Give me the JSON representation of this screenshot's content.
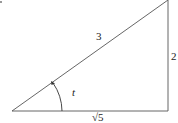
{
  "diagram": {
    "type": "right-triangle",
    "hypotenuse_label": "3",
    "opposite_label": "2",
    "adjacent_label": "√5",
    "angle_label": "t",
    "colors": {
      "stroke": "#555555",
      "text": "#222222",
      "background": "#ffffff"
    }
  }
}
